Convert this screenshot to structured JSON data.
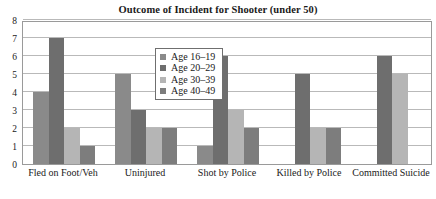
{
  "chart_data": {
    "type": "bar",
    "title": "Outcome of Incident for Shooter (under 50)",
    "xlabel": "",
    "ylabel": "",
    "ylim": [
      0,
      8
    ],
    "yticks": [
      0,
      1,
      2,
      3,
      4,
      5,
      6,
      7,
      8
    ],
    "ytick_labels": [
      "0",
      "1",
      "2",
      "3",
      "4",
      "5",
      "6",
      "7",
      "8"
    ],
    "grid": true,
    "grid_axis": "y",
    "legend_position": "upper center-left (inside plot, boxed)",
    "bar_mode": "grouped",
    "categories": [
      "Fled on Foot/Veh",
      "Uninjured",
      "Shot by Police",
      "Killed by Police",
      "Committed Suicide"
    ],
    "series": [
      {
        "name": "Age 16–19",
        "color": "#8a8a8a",
        "values": [
          4,
          5,
          1,
          0,
          0
        ]
      },
      {
        "name": "Age 20–29",
        "color": "#6e6e6e",
        "values": [
          7,
          3,
          6,
          5,
          6
        ]
      },
      {
        "name": "Age 30–39",
        "color": "#b5b5b5",
        "values": [
          2,
          2,
          3,
          2,
          5
        ]
      },
      {
        "name": "Age 40–49",
        "color": "#7d7d7d",
        "values": [
          1,
          2,
          2,
          2,
          0
        ]
      }
    ]
  },
  "colors": {
    "series_1": "#8a8a8a",
    "series_2": "#6e6e6e",
    "series_3": "#b5b5b5",
    "series_4": "#7d7d7d",
    "gridline": "#b9b9b9",
    "frame": "#9a9a9a",
    "text": "#1a1a1a",
    "background": "#ffffff"
  },
  "legend": {
    "entries": [
      {
        "label": "Age 16–19"
      },
      {
        "label": "Age 20–29"
      },
      {
        "label": "Age 30–39"
      },
      {
        "label": "Age 40–49"
      }
    ]
  }
}
